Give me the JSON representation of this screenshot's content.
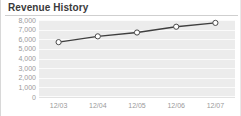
{
  "widget": {
    "title": "Revenue History"
  },
  "chart_data": {
    "type": "line",
    "title": "Revenue History",
    "xlabel": "",
    "ylabel": "",
    "categories": [
      "12/03",
      "12/04",
      "12/05",
      "12/06",
      "12/07"
    ],
    "values": [
      5700,
      6300,
      6700,
      7300,
      7700
    ],
    "series": [
      {
        "name": "Revenue",
        "values": [
          5700,
          6300,
          6700,
          7300,
          7700
        ]
      }
    ],
    "ylim": [
      0,
      8000
    ],
    "ytick_values": [
      8000,
      7000,
      6000,
      5000,
      4000,
      3000,
      2000,
      1000,
      0
    ],
    "ytick_labels": [
      "8,000",
      "7,000",
      "6,000",
      "5,000",
      "4,000",
      "3,000",
      "2,000",
      "1,000",
      "0"
    ],
    "xtick_labels": [
      "12/03",
      "12/04",
      "12/05",
      "12/06",
      "12/07"
    ],
    "grid": true,
    "grid_orientation": "horizontal",
    "legend": false,
    "legend_position": "none",
    "marker": "circle-open",
    "colors": {
      "line": "#3f3f3f",
      "marker_fill": "#ffffff",
      "marker_stroke": "#4a4a4a",
      "plot_background": "#ececec",
      "gridline": "#fbfbfb",
      "tick_label": "#9a9a9a",
      "title": "#3a3a3a",
      "divider": "#cfcfcf"
    }
  }
}
